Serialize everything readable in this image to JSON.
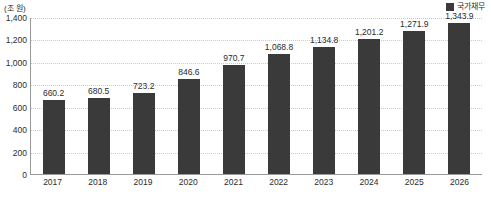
{
  "chart_data": {
    "type": "bar",
    "title": "",
    "unit_label": "(조 원)",
    "xlabel": "",
    "ylabel": "",
    "ylim": [
      0,
      1400
    ],
    "grid": true,
    "legend_position": "top-right",
    "categories": [
      "2017",
      "2018",
      "2019",
      "2020",
      "2021",
      "2022",
      "2023",
      "2024",
      "2025",
      "2026"
    ],
    "yticks": [
      "1,400",
      "1,200",
      "1,000",
      "800",
      "600",
      "400",
      "200",
      "0"
    ],
    "ytick_values": [
      1400,
      1200,
      1000,
      800,
      600,
      400,
      200,
      0
    ],
    "series": [
      {
        "name": "국가채무",
        "color": "#3a3a3a",
        "values": [
          660.2,
          680.5,
          723.2,
          846.6,
          970.7,
          1068.8,
          1134.8,
          1201.2,
          1271.9,
          1343.9
        ],
        "labels": [
          "660.2",
          "680.5",
          "723.2",
          "846.6",
          "970.7",
          "1,068.8",
          "1,134.8",
          "1,201.2",
          "1,271.9",
          "1,343.9"
        ]
      }
    ],
    "legend": [
      {
        "label": "국가채무",
        "color": "#3a3a3a",
        "swatch": "square-swatch-icon"
      }
    ]
  }
}
